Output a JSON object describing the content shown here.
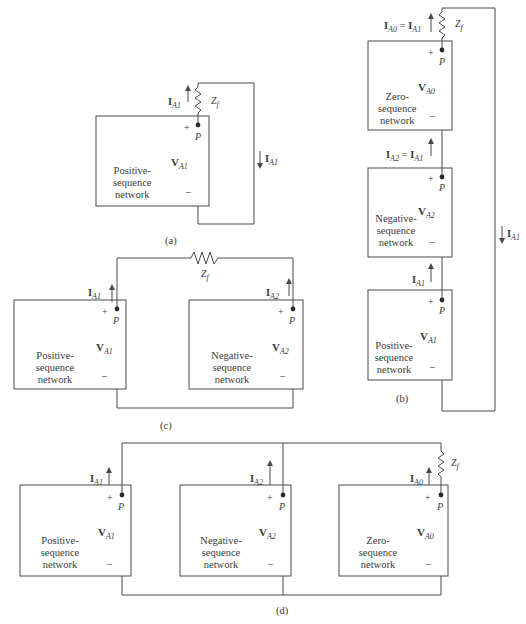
{
  "figure": {
    "panels": [
      {
        "id": "a",
        "caption": "(a)",
        "networks": [
          {
            "name": "Positive-sequence network",
            "line1": "Positive-",
            "line2": "sequence",
            "line3": "network",
            "voltage": "V",
            "voltage_sub": "A1",
            "node": "P",
            "plus": "+",
            "minus": "–"
          }
        ],
        "currents": [
          {
            "label": "I",
            "sub": "A1",
            "direction": "up",
            "position": "beside fault impedance"
          },
          {
            "label": "I",
            "sub": "A1",
            "direction": "down",
            "position": "return wire"
          }
        ],
        "impedance": {
          "label": "Z",
          "sub": "f"
        }
      },
      {
        "id": "b",
        "caption": "(b)",
        "networks": [
          {
            "name": "Zero-sequence network",
            "line1": "Zero-",
            "line2": "sequence",
            "line3": "network",
            "voltage": "V",
            "voltage_sub": "A0",
            "node": "P",
            "plus": "+",
            "minus": "–"
          },
          {
            "name": "Negative-sequence network",
            "line1": "Negative-",
            "line2": "sequence",
            "line3": "network",
            "voltage": "V",
            "voltage_sub": "A2",
            "node": "P",
            "plus": "+",
            "minus": "–"
          },
          {
            "name": "Positive-sequence network",
            "line1": "Positive-",
            "line2": "sequence",
            "line3": "network",
            "voltage": "V",
            "voltage_sub": "A1",
            "node": "P",
            "plus": "+",
            "minus": "–"
          }
        ],
        "currents": [
          {
            "label": "I",
            "sub": "A0",
            "eq": "=",
            "label2": "I",
            "sub2": "A1",
            "direction": "up"
          },
          {
            "label": "I",
            "sub": "A2",
            "eq": "=",
            "label2": "I",
            "sub2": "A1",
            "direction": "up"
          },
          {
            "label": "I",
            "sub": "A1",
            "direction": "up"
          },
          {
            "label": "I",
            "sub": "A1",
            "direction": "down",
            "position": "return wire"
          }
        ],
        "impedance": {
          "label": "Z",
          "sub": "f"
        }
      },
      {
        "id": "c",
        "caption": "(c)",
        "networks": [
          {
            "name": "Positive-sequence network",
            "line1": "Positive-",
            "line2": "sequence",
            "line3": "network",
            "voltage": "V",
            "voltage_sub": "A1",
            "node": "P",
            "plus": "+",
            "minus": "–"
          },
          {
            "name": "Negative-sequence network",
            "line1": "Negative-",
            "line2": "sequence",
            "line3": "network",
            "voltage": "V",
            "voltage_sub": "A2",
            "node": "P",
            "plus": "+",
            "minus": "–"
          }
        ],
        "currents": [
          {
            "label": "I",
            "sub": "A1",
            "direction": "up"
          },
          {
            "label": "I",
            "sub": "A2",
            "direction": "up"
          }
        ],
        "impedance": {
          "label": "Z",
          "sub": "f"
        }
      },
      {
        "id": "d",
        "caption": "(d)",
        "networks": [
          {
            "name": "Positive-sequence network",
            "line1": "Positive-",
            "line2": "sequence",
            "line3": "network",
            "voltage": "V",
            "voltage_sub": "A1",
            "node": "P",
            "plus": "+",
            "minus": "–"
          },
          {
            "name": "Negative-sequence network",
            "line1": "Negative-",
            "line2": "sequence",
            "line3": "network",
            "voltage": "V",
            "voltage_sub": "A2",
            "node": "P",
            "plus": "+",
            "minus": "–"
          },
          {
            "name": "Zero-sequence network",
            "line1": "Zero-",
            "line2": "sequence",
            "line3": "network",
            "voltage": "V",
            "voltage_sub": "A0",
            "node": "P",
            "plus": "+",
            "minus": "–"
          }
        ],
        "currents": [
          {
            "label": "I",
            "sub": "A1",
            "direction": "up"
          },
          {
            "label": "I",
            "sub": "A2",
            "direction": "up"
          },
          {
            "label": "I",
            "sub": "A0",
            "direction": "up"
          }
        ],
        "impedance": {
          "label": "Z",
          "sub": "f"
        }
      }
    ],
    "colors": {
      "line": "#4a4a4a",
      "text": "#3a3a3a",
      "background": "#ffffff"
    }
  }
}
